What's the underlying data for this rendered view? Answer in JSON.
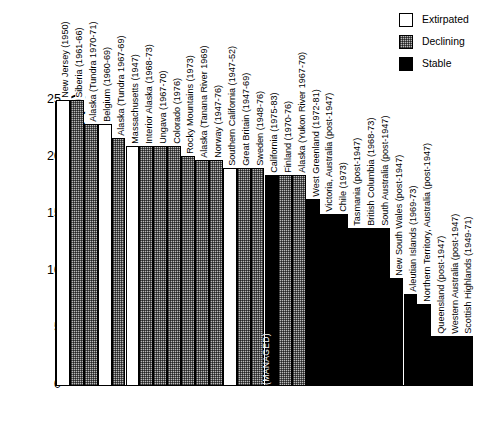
{
  "chart_data": {
    "type": "bar",
    "title": "",
    "xlabel": "",
    "ylabel": "Shell-thinning (%)",
    "ylim": [
      0,
      25
    ],
    "yticks": [
      0,
      5,
      10,
      15,
      20,
      25
    ],
    "grid": false,
    "legend_position": "top-right",
    "legend": [
      {
        "label": "Extirpated",
        "status": "extirpated",
        "color": "#ffffff"
      },
      {
        "label": "Declining",
        "status": "declining",
        "color": "#b9b9b9"
      },
      {
        "label": "Stable",
        "status": "stable",
        "color": "#000000"
      }
    ],
    "categories": [
      "New Jersey (1950)",
      "Siberia (1961-66)",
      "Alaska (Tundra 1970-71)",
      "Belgium (1960-69)",
      "Alaska (Tundra 1967-69)",
      "Massachusetts (1947)",
      "Interior Alaska (1968-73)",
      "Ungava (1967-70)",
      "Colorado (1976)",
      "Rocky Mountains (1973)",
      "Alaska (Tanana River 1969)",
      "Norway (1947-76)",
      "Southern California (1947-52)",
      "Great Britain (1947-69)",
      "Sweden (1948-76)",
      "California (1975-83)",
      "Finland (1970-76)",
      "Alaska (Yukon River 1967-70)",
      "West Greenland (1972-81)",
      "Victoria, Australia (post-1947)",
      "Chile (1973)",
      "Tasmania (post-1947)",
      "British Columbia (1968-73)",
      "South Australia (post-1947)",
      "New South Wales (post-1947)",
      "Aleutian Islands (1969-73)",
      "Northern Territory, Australia (post-1947)",
      "Queensland (post-1947)",
      "Western Australia (post-1947)",
      "Scottish Highlands (1949-71)"
    ],
    "values": [
      25.0,
      25.0,
      22.9,
      22.9,
      21.7,
      21.0,
      21.0,
      21.0,
      21.0,
      20.1,
      19.7,
      19.7,
      19.0,
      19.0,
      19.0,
      18.4,
      18.4,
      18.4,
      16.3,
      15.0,
      15.0,
      13.8,
      13.8,
      13.8,
      9.4,
      8.0,
      7.1,
      4.3,
      4.3,
      4.3
    ],
    "statuses": [
      "extirpated",
      "declining",
      "declining",
      "extirpated",
      "declining",
      "extirpated",
      "declining",
      "declining",
      "declining",
      "declining",
      "declining",
      "declining",
      "extirpated",
      "declining",
      "declining",
      "stable",
      "declining",
      "declining",
      "stable",
      "stable",
      "stable",
      "stable",
      "stable",
      "stable",
      "stable",
      "stable",
      "stable",
      "stable",
      "stable",
      "stable"
    ],
    "annotations": [
      {
        "category": "California (1975-83)",
        "text": "(MANAGED)",
        "orientation": "vertical"
      }
    ]
  }
}
